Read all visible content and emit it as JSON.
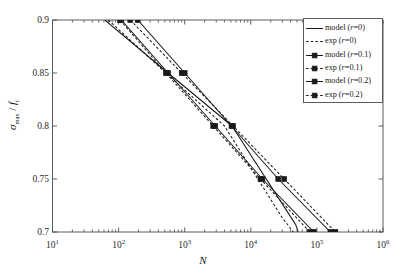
{
  "chart_data": {
    "type": "line",
    "title": "",
    "xlabel": "N",
    "ylabel": "σmax / ft",
    "xscale": "log",
    "yscale": "linear",
    "xlim": [
      10,
      1000000
    ],
    "ylim": [
      0.7,
      0.9
    ],
    "grid": false,
    "legend_position": "top-right",
    "xticklabels": [
      "10",
      "10",
      "10",
      "10",
      "10",
      "10"
    ],
    "xtickexponents": [
      "1",
      "2",
      "3",
      "4",
      "5",
      "6"
    ],
    "xtickvalues": [
      10,
      100,
      1000,
      10000,
      100000,
      1000000
    ],
    "yticklabels": [
      "0.7",
      "0.75",
      "0.8",
      "0.85",
      "0.9"
    ],
    "ytickvalues": [
      0.7,
      0.75,
      0.8,
      0.85,
      0.9
    ],
    "series": [
      {
        "name": "model (r=0)",
        "style": "solid",
        "marker": "none",
        "color": "#1a1a1a",
        "x": [
          62,
          560,
          5200,
          48000,
          52000
        ],
        "y": [
          0.9,
          0.85,
          0.8,
          0.7067,
          0.7
        ]
      },
      {
        "name": "exp (r=0)",
        "style": "dashed",
        "marker": "none",
        "color": "#1a1a1a",
        "x": [
          70,
          520,
          4000,
          30000,
          44000
        ],
        "y": [
          0.9,
          0.85,
          0.8,
          0.7133,
          0.7
        ]
      },
      {
        "name": "model (r=0.1)",
        "style": "solid",
        "marker": "square",
        "color": "#1a1a1a",
        "x": [
          110,
          560,
          2900,
          15000,
          90000
        ],
        "y": [
          0.9,
          0.85,
          0.8,
          0.75,
          0.7
        ]
      },
      {
        "name": "exp (r=0.1)",
        "style": "dashed",
        "marker": "square",
        "color": "#1a1a1a",
        "x": [
          105,
          520,
          2700,
          14000,
          78000
        ],
        "y": [
          0.9,
          0.85,
          0.8,
          0.75,
          0.7
        ]
      },
      {
        "name": "model (r=0.2)",
        "style": "solid",
        "marker": "square",
        "color": "#1a1a1a",
        "x": [
          195,
          1000,
          5100,
          26000,
          160000
        ],
        "y": [
          0.9,
          0.85,
          0.8,
          0.75,
          0.7
        ]
      },
      {
        "name": "exp (r=0.2)",
        "style": "dashed",
        "marker": "square",
        "color": "#1a1a1a",
        "x": [
          150,
          900,
          5400,
          32000,
          190000
        ],
        "y": [
          0.9,
          0.85,
          0.8,
          0.75,
          0.7
        ]
      }
    ]
  },
  "axes": {
    "xlabel": "N",
    "ylabel_sigma": "σ",
    "ylabel_sub": "max",
    "ylabel_div": " / ",
    "ylabel_f": "f",
    "ylabel_fsub": "t",
    "yticks": [
      "0.9",
      "0.85",
      "0.8",
      "0.75",
      "0.7"
    ],
    "xticks": [
      {
        "mantissa": "10",
        "exp": "1"
      },
      {
        "mantissa": "10",
        "exp": "2"
      },
      {
        "mantissa": "10",
        "exp": "3"
      },
      {
        "mantissa": "10",
        "exp": "4"
      },
      {
        "mantissa": "10",
        "exp": "5"
      },
      {
        "mantissa": "10",
        "exp": "6"
      }
    ]
  },
  "legend": {
    "entries": [
      {
        "label_pre": "model (",
        "label_it": "r",
        "label_post": "=0)",
        "style": "solid",
        "marker": "none"
      },
      {
        "label_pre": "exp (",
        "label_it": "r",
        "label_post": "=0)",
        "style": "dashed",
        "marker": "none"
      },
      {
        "label_pre": "model (",
        "label_it": "r",
        "label_post": "=0.1)",
        "style": "solid",
        "marker": "square"
      },
      {
        "label_pre": "exp (",
        "label_it": "r",
        "label_post": "=0.1)",
        "style": "dashed",
        "marker": "square"
      },
      {
        "label_pre": "model (",
        "label_it": "r",
        "label_post": "=0.2)",
        "style": "solid",
        "marker": "square"
      },
      {
        "label_pre": "exp (",
        "label_it": "r",
        "label_post": "=0.2)",
        "style": "dashed",
        "marker": "square"
      }
    ]
  },
  "colors": {
    "line": "#1a1a1a",
    "axis": "#4d4d4d",
    "background": "#ffffff"
  }
}
